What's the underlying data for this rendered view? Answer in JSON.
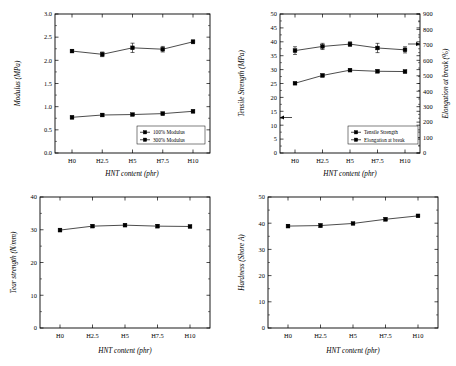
{
  "figure": {
    "name": "mechanical-properties-of-HNT-filled-composites",
    "panel_count": 4
  },
  "chart_data": [
    {
      "id": "modulus",
      "type": "line",
      "title": "",
      "xlabel": "HNT content (phr)",
      "ylabel": "Modulus (MPa)",
      "categories": [
        "H0",
        "H2.5",
        "H5",
        "H7.5",
        "H10"
      ],
      "ylim": [
        0.0,
        3.0
      ],
      "yticks": [
        0.0,
        0.5,
        1.0,
        1.5,
        2.0,
        2.5,
        3.0
      ],
      "ytick_labels": [
        "0.0",
        "0.5",
        "1.0",
        "1.5",
        "2.0",
        "2.5",
        "3.0"
      ],
      "grid": false,
      "legend_position": "lower-right",
      "series": [
        {
          "name": "100% Modulus",
          "marker": "square",
          "values": [
            0.77,
            0.82,
            0.83,
            0.85,
            0.9
          ],
          "errors": [
            0.03,
            0.03,
            0.02,
            0.03,
            0.03
          ]
        },
        {
          "name": "300% Modulus",
          "marker": "square",
          "values": [
            2.2,
            2.13,
            2.27,
            2.24,
            2.4
          ],
          "errors": [
            0.03,
            0.05,
            0.1,
            0.06,
            0.04
          ]
        }
      ]
    },
    {
      "id": "tensile-elongation",
      "type": "line",
      "title": "",
      "xlabel": "HNT content (phr)",
      "ylabel": "Tensile Strength (MPa)",
      "y2label": "Elongation at break (%)",
      "categories": [
        "H0",
        "H2.5",
        "H5",
        "H7.5",
        "H10"
      ],
      "ylim": [
        0,
        50
      ],
      "yticks": [
        0,
        5,
        10,
        15,
        20,
        25,
        30,
        35,
        40,
        45,
        50
      ],
      "ytick_labels": [
        "0",
        "5",
        "10",
        "15",
        "20",
        "25",
        "30",
        "35",
        "40",
        "45",
        "50"
      ],
      "y2lim": [
        0,
        900
      ],
      "y2ticks": [
        0,
        100,
        200,
        300,
        400,
        500,
        600,
        700,
        800,
        900
      ],
      "y2tick_labels": [
        "0",
        "100",
        "200",
        "300",
        "400",
        "500",
        "600",
        "700",
        "800",
        "900"
      ],
      "grid": false,
      "legend_position": "lower-right",
      "series": [
        {
          "name": "Tensile Strength",
          "axis": "left",
          "marker": "square",
          "values": [
            25.1,
            27.9,
            29.8,
            29.4,
            29.3
          ],
          "errors": [
            0.3,
            0.5,
            0.4,
            0.5,
            0.5
          ]
        },
        {
          "name": "Elongation at break",
          "axis": "right",
          "marker": "square",
          "values": [
            663,
            690,
            705,
            680,
            668
          ],
          "errors": [
            25,
            20,
            15,
            30,
            20
          ]
        }
      ]
    },
    {
      "id": "tear-strength",
      "type": "line",
      "title": "",
      "xlabel": "HNT content (phr)",
      "ylabel": "Tear strength (N/mm)",
      "categories": [
        "H0",
        "H2.5",
        "H5",
        "H7.5",
        "H10"
      ],
      "ylim": [
        0,
        40
      ],
      "yticks": [
        0,
        10,
        20,
        30,
        40
      ],
      "ytick_labels": [
        "0",
        "10",
        "20",
        "30",
        "40"
      ],
      "grid": false,
      "series": [
        {
          "name": "Tear strength",
          "marker": "square",
          "values": [
            29.9,
            31.1,
            31.4,
            31.1,
            31.0
          ],
          "errors": [
            0.5,
            0.4,
            0.4,
            0.5,
            0.4
          ]
        }
      ]
    },
    {
      "id": "hardness",
      "type": "line",
      "title": "",
      "xlabel": "HNT content (phr)",
      "ylabel": "Hardness (Shore A)",
      "categories": [
        "H0",
        "H2.5",
        "H5",
        "H7.5",
        "H10"
      ],
      "ylim": [
        0,
        50
      ],
      "yticks": [
        0,
        10,
        20,
        30,
        40,
        50
      ],
      "ytick_labels": [
        "0",
        "10",
        "20",
        "30",
        "40",
        "50"
      ],
      "grid": false,
      "series": [
        {
          "name": "Hardness",
          "marker": "square",
          "values": [
            38.9,
            39.1,
            39.9,
            41.5,
            42.8
          ],
          "errors": [
            0.6,
            0.7,
            0.3,
            0.6,
            0.4
          ]
        }
      ]
    }
  ],
  "colors": {
    "axis": "#000000",
    "marker": "#000000",
    "line": "#000000",
    "background": "#ffffff"
  }
}
